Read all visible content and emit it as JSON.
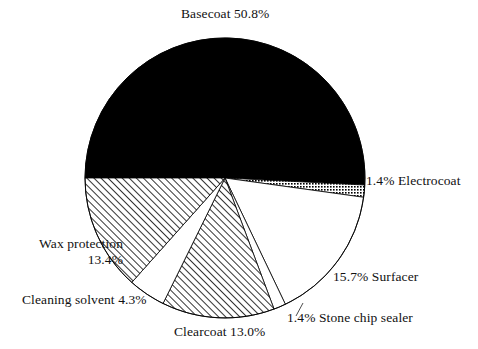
{
  "chart_data": {
    "type": "pie",
    "title": "",
    "subtitle": "",
    "xlabel": "",
    "ylabel": "",
    "legend_position": "none",
    "grid": false,
    "units": "percent",
    "start_angle_deg": 180,
    "direction": "clockwise",
    "categories": [
      "Basecoat",
      "Electrocoat",
      "Surfacer",
      "Stone chip sealer",
      "Clearcoat",
      "Cleaning solvent",
      "Wax protection"
    ],
    "values": [
      50.8,
      1.4,
      15.7,
      1.4,
      13.0,
      4.3,
      13.4
    ],
    "slices": [
      {
        "name": "Basecoat",
        "value": 50.8,
        "value_text": "50.8%",
        "label_text": "Basecoat 50.8%",
        "fill_style": "solid-black",
        "fill_color": "#000000",
        "start_deg": 180,
        "end_deg": 362.88
      },
      {
        "name": "Electrocoat",
        "value": 1.4,
        "value_text": "1.4%",
        "label_text": "1.4% Electrocoat",
        "fill_style": "dotted",
        "fill_color": "#000000",
        "start_deg": 362.88,
        "end_deg": 367.92
      },
      {
        "name": "Surfacer",
        "value": 15.7,
        "value_text": "15.7%",
        "label_text": "15.7% Surfacer",
        "fill_style": "white",
        "fill_color": "#ffffff",
        "start_deg": 367.92,
        "end_deg": 424.44
      },
      {
        "name": "Stone chip sealer",
        "value": 1.4,
        "value_text": "1.4%",
        "label_text": "1.4% Stone chip sealer",
        "fill_style": "white",
        "fill_color": "#ffffff",
        "start_deg": 424.44,
        "end_deg": 429.48
      },
      {
        "name": "Clearcoat",
        "value": 13.0,
        "value_text": "13.0%",
        "label_text": "Clearcoat 13.0%",
        "fill_style": "diagonal-hatch",
        "fill_color": "#000000",
        "start_deg": 429.48,
        "end_deg": 476.28
      },
      {
        "name": "Cleaning solvent",
        "value": 4.3,
        "value_text": "4.3%",
        "label_text": "Cleaning solvent 4.3%",
        "fill_style": "white",
        "fill_color": "#ffffff",
        "start_deg": 476.28,
        "end_deg": 491.76
      },
      {
        "name": "Wax protection",
        "value": 13.4,
        "value_text": "13.4%",
        "label_text": "Wax protection 13.4%",
        "fill_style": "diagonal-hatch",
        "fill_color": "#000000",
        "start_deg": 491.76,
        "end_deg": 540.0
      }
    ],
    "colors": {
      "background": "#ffffff",
      "outline": "#000000",
      "text": "#111111",
      "solid_slice": "#000000"
    }
  },
  "labels": {
    "basecoat": "Basecoat 50.8%",
    "electrocoat": "1.4% Electrocoat",
    "surfacer": "15.7% Surfacer",
    "stone_chip_sealer": "1.4% Stone chip sealer",
    "clearcoat": "Clearcoat 13.0%",
    "cleaning_solvent": "Cleaning solvent 4.3%",
    "wax_protection_line1": "Wax protection",
    "wax_protection_line2": "13.4%"
  }
}
